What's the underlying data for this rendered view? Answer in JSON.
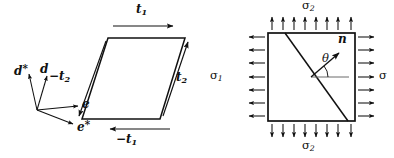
{
  "figure": {
    "stroke_color": "#111111",
    "background": "#ffffff"
  },
  "left_panel": {
    "name": "parallelogram-traction-diagram",
    "basis_frame": {
      "label_d_star": "d",
      "label_d_star_sup": "*",
      "label_d": "d",
      "label_e": "e",
      "label_e_star": "e",
      "label_e_star_sup": "*",
      "origin": [
        37,
        110
      ],
      "vectors": [
        {
          "name": "d-star-axis",
          "label": "d*",
          "tip": [
            28,
            72
          ]
        },
        {
          "name": "d-axis",
          "label": "d",
          "tip": [
            47,
            74
          ]
        },
        {
          "name": "e-axis",
          "label": "e",
          "tip": [
            82,
            105
          ]
        },
        {
          "name": "e-star-axis",
          "label": "e*",
          "tip": [
            76,
            125
          ]
        }
      ]
    },
    "element": {
      "name": "parallelogram",
      "corners": [
        [
          108,
          38
        ],
        [
          185,
          38
        ],
        [
          160,
          119
        ],
        [
          82,
          119
        ]
      ]
    },
    "tractions": [
      {
        "name": "traction-t1-top",
        "label_base": "t",
        "label_sub": "1",
        "sign": "",
        "direction": "right",
        "label_pos": [
          139,
          6
        ]
      },
      {
        "name": "traction-t2-right",
        "label_base": "t",
        "label_sub": "2",
        "sign": "",
        "direction": "up-right",
        "label_pos": [
          178,
          78
        ]
      },
      {
        "name": "traction-neg-t2-left",
        "label_base": "t",
        "label_sub": "2",
        "sign": "−",
        "direction": "down-left",
        "label_pos": [
          57,
          76
        ]
      },
      {
        "name": "traction-neg-t1-bottom",
        "label_base": "t",
        "label_sub": "1",
        "sign": "−",
        "direction": "left",
        "label_pos": [
          124,
          138
        ]
      }
    ]
  },
  "right_panel": {
    "name": "biaxial-stress-square-diagram",
    "element": {
      "name": "square",
      "corners": [
        [
          268,
          33
        ],
        [
          355,
          33
        ],
        [
          355,
          121
        ],
        [
          268,
          121
        ]
      ]
    },
    "cut_plane": {
      "name": "cut-plane-line",
      "from": [
        285,
        33
      ],
      "to": [
        348,
        121
      ]
    },
    "normal_vector": {
      "name": "normal-vector-n",
      "label": "n",
      "from": [
        311,
        77
      ],
      "to": [
        340,
        52
      ],
      "label_pos": [
        341,
        38
      ]
    },
    "reference_line": {
      "name": "reference-horizontal",
      "from": [
        311,
        77
      ],
      "to": [
        348,
        77
      ]
    },
    "angle": {
      "name": "angle-theta",
      "label": "θ",
      "label_pos": [
        325,
        58
      ],
      "arc_radius": 17
    },
    "stress_labels": [
      {
        "name": "stress-label-sigma2-top",
        "base": "σ",
        "sub": "2",
        "pos": [
          307,
          2
        ],
        "edge": "top"
      },
      {
        "name": "stress-label-sigma2-bottom",
        "base": "σ",
        "sub": "2",
        "pos": [
          307,
          140
        ],
        "edge": "bottom"
      },
      {
        "name": "stress-label-sigma1-left",
        "base": "σ",
        "sub": "1",
        "pos": [
          213,
          70
        ],
        "edge": "left"
      },
      {
        "name": "stress-label-sigma-right",
        "base": "σ",
        "sub": "",
        "pos": [
          381,
          70
        ],
        "edge": "right"
      }
    ],
    "arrow_rows": {
      "top_count": 8,
      "bottom_count": 8,
      "left_count": 7,
      "right_count": 7,
      "top_direction": "up",
      "bottom_direction": "down",
      "left_direction": "left",
      "right_direction": "right"
    }
  }
}
